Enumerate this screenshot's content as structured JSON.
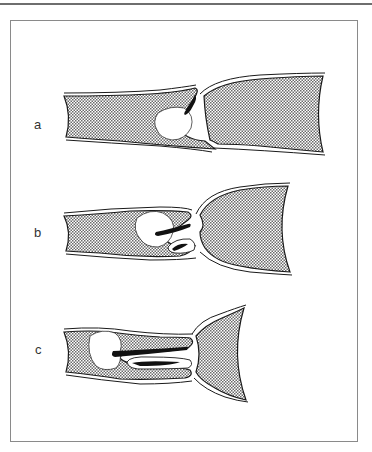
{
  "figure": {
    "panels": [
      {
        "label": "a"
      },
      {
        "label": "b"
      },
      {
        "label": "c"
      }
    ]
  },
  "colors": {
    "outline": "#1a1a1a",
    "texture": "#7a7a7a",
    "frame": "#8a8a8a",
    "rule": "#6e6e6e"
  }
}
